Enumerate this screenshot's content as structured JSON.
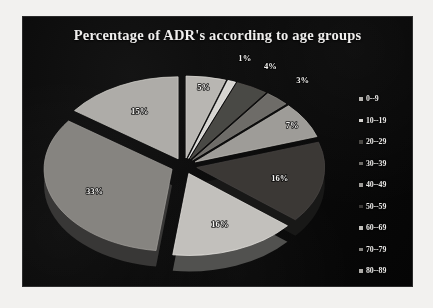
{
  "chart_data": {
    "type": "pie",
    "title": "Percentage of ADR's according to age groups",
    "xlabel": "",
    "ylabel": "",
    "legend_position": "right",
    "grid": false,
    "exploded": true,
    "three_d": true,
    "categories": [
      "0--9",
      "10--19",
      "20--29",
      "30--39",
      "40--49",
      "50--59",
      "60--69",
      "70--79",
      "80--89"
    ],
    "values": [
      5,
      1,
      4,
      3,
      7,
      16,
      16,
      33,
      15
    ],
    "value_labels": [
      "5%",
      "1%",
      "4%",
      "3%",
      "7%",
      "16%",
      "16%",
      "33%",
      "15%"
    ],
    "slice_colors": [
      "#b8b6b2",
      "#d6d4d0",
      "#4a4844",
      "#6e6c68",
      "#9e9c98",
      "#3a3836",
      "#c2c0bc",
      "#868480",
      "#aeaca8"
    ],
    "total": 100
  },
  "panel": {
    "background_color": "#080808",
    "title_color": "#f0efee"
  },
  "legend": {
    "items": [
      {
        "label": "0--9",
        "color": "#b8b6b2"
      },
      {
        "label": "10--19",
        "color": "#d6d4d0"
      },
      {
        "label": "20--29",
        "color": "#4a4844"
      },
      {
        "label": "30--39",
        "color": "#6e6c68"
      },
      {
        "label": "40--49",
        "color": "#9e9c98"
      },
      {
        "label": "50--59",
        "color": "#3a3836"
      },
      {
        "label": "60--69",
        "color": "#c2c0bc"
      },
      {
        "label": "70--79",
        "color": "#868480"
      },
      {
        "label": "80--89",
        "color": "#aeaca8"
      }
    ]
  }
}
